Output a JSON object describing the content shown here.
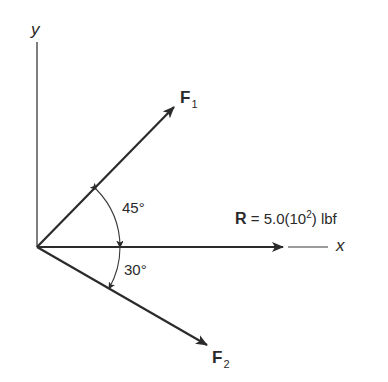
{
  "diagram": {
    "type": "force-vector-diagram",
    "axes": {
      "y_label": "y",
      "x_label": "x"
    },
    "vectors": [
      {
        "id": "F1",
        "symbol": "F",
        "subscript": "1",
        "angle_label": "45°",
        "direction": "above x-axis"
      },
      {
        "id": "R",
        "symbol": "R",
        "equation": " = 5.0(10",
        "exponent": "2",
        "units": ") lbf",
        "direction": "along +x"
      },
      {
        "id": "F2",
        "symbol": "F",
        "subscript": "2",
        "angle_label": "30°",
        "direction": "below x-axis"
      }
    ],
    "colors": {
      "line": "#2b2b2b",
      "background": "#ffffff"
    }
  }
}
